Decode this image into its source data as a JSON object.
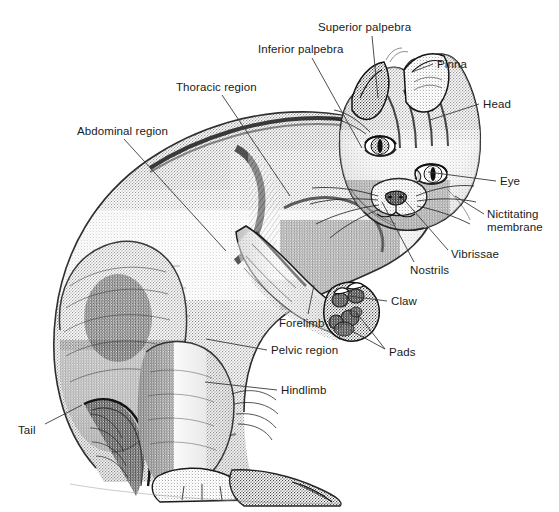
{
  "figure": {
    "style": "pen-and-ink stipple drawing",
    "background_color": "#ffffff",
    "ink_color": "#1a1a1a",
    "leader_line_color": "#3a3a3a",
    "width": 559,
    "height": 512
  },
  "labels": [
    {
      "id": "superior-palpebra",
      "text": "Superior palpebra",
      "x": 318,
      "y": 21,
      "align": "left",
      "leader": [
        [
          372,
          36
        ],
        [
          378,
          98
        ]
      ]
    },
    {
      "id": "inferior-palpebra",
      "text": "Inferior palpebra",
      "x": 258,
      "y": 43,
      "align": "left",
      "leader": [
        [
          312,
          58
        ],
        [
          362,
          148
        ]
      ]
    },
    {
      "id": "pinna",
      "text": "Pinna",
      "x": 437,
      "y": 58,
      "align": "left",
      "leader": [
        [
          433,
          64
        ],
        [
          412,
          72
        ]
      ]
    },
    {
      "id": "head",
      "text": "Head",
      "x": 483,
      "y": 98,
      "align": "left",
      "leader": [
        [
          479,
          104
        ],
        [
          430,
          120
        ]
      ]
    },
    {
      "id": "thoracic-region",
      "text": "Thoracic region",
      "x": 176,
      "y": 81,
      "align": "left",
      "leader": [
        [
          222,
          95
        ],
        [
          290,
          196
        ]
      ]
    },
    {
      "id": "abdominal-region",
      "text": "Abdominal region",
      "x": 77,
      "y": 125,
      "align": "left",
      "leader": [
        [
          124,
          139
        ],
        [
          226,
          251
        ]
      ]
    },
    {
      "id": "eye",
      "text": "Eye",
      "x": 500,
      "y": 175,
      "align": "left",
      "leader": [
        [
          496,
          181
        ],
        [
          428,
          172
        ]
      ]
    },
    {
      "id": "nictitating-membrane",
      "text": "Nictitating\nmembrane",
      "x": 487,
      "y": 208,
      "align": "left",
      "leader": [
        [
          484,
          214
        ],
        [
          455,
          196
        ]
      ]
    },
    {
      "id": "vibrissae",
      "text": "Vibrissae",
      "x": 451,
      "y": 248,
      "align": "left",
      "leader": [
        [
          448,
          250
        ],
        [
          400,
          195
        ]
      ]
    },
    {
      "id": "nostrils",
      "text": "Nostrils",
      "x": 410,
      "y": 264,
      "align": "left",
      "leader": [
        [
          414,
          262
        ],
        [
          382,
          202
        ]
      ]
    },
    {
      "id": "claw",
      "text": "Claw",
      "x": 391,
      "y": 295,
      "align": "left",
      "leader": [
        [
          387,
          301
        ],
        [
          349,
          296
        ]
      ]
    },
    {
      "id": "forelimb",
      "text": "Forelimb",
      "x": 279,
      "y": 317,
      "align": "left",
      "leader": [
        [
          308,
          314
        ],
        [
          314,
          285
        ]
      ]
    },
    {
      "id": "pelvic-region",
      "text": "Pelvic region",
      "x": 271,
      "y": 344,
      "align": "left",
      "leader": [
        [
          267,
          350
        ],
        [
          206,
          339
        ]
      ]
    },
    {
      "id": "pads",
      "text": "Pads",
      "x": 389,
      "y": 346,
      "align": "left",
      "leader": [
        [
          385,
          349
        ],
        [
          350,
          330
        ]
      ],
      "leader2": [
        [
          385,
          349
        ],
        [
          356,
          312
        ]
      ]
    },
    {
      "id": "hindlimb",
      "text": "Hindlimb",
      "x": 281,
      "y": 384,
      "align": "left",
      "leader": [
        [
          277,
          390
        ],
        [
          205,
          382
        ]
      ]
    },
    {
      "id": "tail",
      "text": "Tail",
      "x": 18,
      "y": 424,
      "align": "left",
      "leader": [
        [
          45,
          424
        ],
        [
          82,
          405
        ]
      ]
    }
  ]
}
